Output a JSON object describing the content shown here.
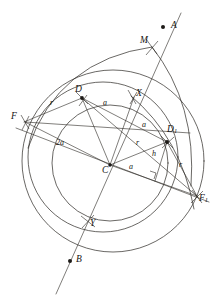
{
  "figure": {
    "background_color": "#ffffff",
    "ink_color": "#2a2622",
    "width": 221,
    "height": 305
  },
  "points": [
    {
      "id": "A",
      "label": "A",
      "x": 163,
      "y": 27,
      "label_x": 171,
      "label_y": 21,
      "marker": "dot"
    },
    {
      "id": "B",
      "label": "B",
      "x": 70,
      "y": 261,
      "label_x": 76,
      "label_y": 256,
      "marker": "dot"
    },
    {
      "id": "M",
      "label": "M",
      "x": 152,
      "y": 47,
      "label_x": 141,
      "label_y": 37,
      "marker": "cross"
    },
    {
      "id": "X",
      "label": "X",
      "x": 133,
      "y": 99,
      "label_x": 136,
      "label_y": 91,
      "marker": "cross"
    },
    {
      "id": "Y",
      "label": "Y",
      "x": 88,
      "y": 222,
      "label_x": 90,
      "label_y": 220,
      "marker": "cross"
    },
    {
      "id": "D",
      "label": "D",
      "x": 82,
      "y": 98,
      "label_x": 76,
      "label_y": 87,
      "marker": "node"
    },
    {
      "id": "D1",
      "label": "D",
      "sub": "1",
      "x": 167,
      "y": 142,
      "label_x": 168,
      "label_y": 127,
      "marker": "node"
    },
    {
      "id": "F",
      "label": "F",
      "x": 25,
      "y": 122,
      "label_x": 12,
      "label_y": 114,
      "marker": "cross"
    },
    {
      "id": "F1",
      "label": "F",
      "sub": "1",
      "x": 197,
      "y": 196,
      "label_x": 199,
      "label_y": 196,
      "marker": "cross"
    },
    {
      "id": "C",
      "label": "C",
      "x": 110,
      "y": 165,
      "label_x": 103,
      "label_y": 167,
      "marker": "node"
    }
  ],
  "segment_labels": [
    {
      "id": "r-left",
      "text": "r",
      "x": 51,
      "y": 101
    },
    {
      "id": "two-a",
      "text": "2a",
      "x": 58,
      "y": 142
    },
    {
      "id": "a-upper",
      "text": "a",
      "x": 104,
      "y": 101
    },
    {
      "id": "a-middle",
      "text": "a",
      "x": 143,
      "y": 123
    },
    {
      "id": "a-lower",
      "text": "a",
      "x": 130,
      "y": 165
    },
    {
      "id": "r-inner",
      "text": "r",
      "x": 137,
      "y": 141
    },
    {
      "id": "h",
      "text": "h",
      "x": 153,
      "y": 153
    },
    {
      "id": "r-right",
      "text": "r",
      "x": 180,
      "y": 164
    }
  ],
  "circles": [
    {
      "id": "outer-circle",
      "cx": 113,
      "cy": 161,
      "r": 91
    },
    {
      "id": "middle-circle",
      "cx": 103,
      "cy": 157,
      "r": 75
    },
    {
      "id": "inner-circle",
      "cx": 110,
      "cy": 163,
      "r": 58
    }
  ],
  "arcs": [
    {
      "id": "arc-through-M-left",
      "d": "M 28 148 Q 60 62 152 47"
    },
    {
      "id": "arc-through-M-right",
      "d": "M 152 47 Q 196 105 190 185"
    },
    {
      "id": "arc-lower-right",
      "d": "M 131 97 Q 182 140 193 208"
    }
  ],
  "lines": [
    {
      "id": "line-AB",
      "x1": 181,
      "y1": 14,
      "x2": 57,
      "y2": 293
    },
    {
      "id": "line-F-F1",
      "x1": 17,
      "y1": 128,
      "x2": 208,
      "y2": 201
    },
    {
      "id": "line-F-D1",
      "x1": 25,
      "y1": 122,
      "x2": 184,
      "y2": 136
    },
    {
      "id": "line-D-F1",
      "x1": 82,
      "y1": 98,
      "x2": 197,
      "y2": 196
    },
    {
      "id": "line-D-D1",
      "x1": 82,
      "y1": 98,
      "x2": 167,
      "y2": 142
    },
    {
      "id": "line-D-C",
      "x1": 82,
      "y1": 98,
      "x2": 110,
      "y2": 165
    },
    {
      "id": "line-C-D1",
      "x1": 110,
      "y1": 165,
      "x2": 167,
      "y2": 142
    },
    {
      "id": "line-C-X",
      "x1": 110,
      "y1": 165,
      "x2": 133,
      "y2": 99
    },
    {
      "id": "line-D-F",
      "x1": 82,
      "y1": 98,
      "x2": 25,
      "y2": 122
    },
    {
      "id": "line-D1-foot",
      "x1": 167,
      "y1": 142,
      "x2": 155,
      "y2": 180
    },
    {
      "id": "line-D1-tail",
      "x1": 167,
      "y1": 142,
      "x2": 189,
      "y2": 133
    },
    {
      "id": "line-D-Y",
      "x1": 82,
      "y1": 98,
      "x2": 88,
      "y2": 222
    },
    {
      "id": "line-C-F1b",
      "x1": 110,
      "y1": 165,
      "x2": 197,
      "y2": 196
    }
  ],
  "markers": {
    "right_angle": {
      "id": "right-angle-marker",
      "x": 150,
      "y": 172,
      "size": 6
    }
  }
}
